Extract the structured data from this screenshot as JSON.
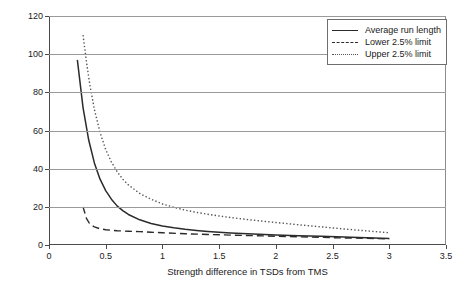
{
  "chart_data": {
    "type": "line",
    "title": "",
    "xlabel": "Strength difference in TSDs from TMS",
    "ylabel": "No. of results to detect action",
    "xlim": [
      0,
      3.5
    ],
    "ylim": [
      0,
      120
    ],
    "xticks": [
      "0",
      "0.5",
      "1",
      "1.5",
      "2",
      "2.5",
      "3",
      "3.5"
    ],
    "xtick_values": [
      0,
      0.5,
      1,
      1.5,
      2,
      2.5,
      3,
      3.5
    ],
    "yticks": [
      "0",
      "20",
      "40",
      "60",
      "80",
      "100",
      "120"
    ],
    "ytick_values": [
      0,
      20,
      40,
      60,
      80,
      100,
      120
    ],
    "grid": "horizontal",
    "legend_position": "top-right",
    "series": [
      {
        "name": "Average run length",
        "style": "solid",
        "color": "#2b2b2b",
        "x": [
          0.25,
          0.3,
          0.35,
          0.4,
          0.45,
          0.5,
          0.55,
          0.6,
          0.65,
          0.7,
          0.8,
          0.9,
          1.0,
          1.1,
          1.2,
          1.3,
          1.4,
          1.5,
          1.6,
          1.7,
          1.8,
          2.0,
          2.2,
          2.4,
          2.6,
          2.8,
          3.0
        ],
        "values": [
          97.0,
          72.0,
          55.0,
          43.0,
          34.5,
          28.5,
          24.0,
          20.5,
          18.0,
          16.0,
          13.2,
          11.3,
          10.0,
          9.0,
          8.2,
          7.6,
          7.1,
          6.7,
          6.3,
          6.0,
          5.8,
          5.3,
          4.9,
          4.6,
          4.2,
          3.8,
          3.4
        ]
      },
      {
        "name": "Lower 2.5% limit",
        "style": "dashed",
        "color": "#2b2b2b",
        "x": [
          0.3,
          0.33,
          0.36,
          0.4,
          0.45,
          0.5,
          0.6,
          0.7,
          0.8,
          0.9,
          1.0,
          1.2,
          1.4,
          1.6,
          1.8,
          2.0,
          2.2,
          2.4,
          2.6,
          2.8,
          3.0
        ],
        "values": [
          20.0,
          14.0,
          11.0,
          9.5,
          8.5,
          8.0,
          7.5,
          7.2,
          7.0,
          6.7,
          6.4,
          5.9,
          5.5,
          5.2,
          4.9,
          4.6,
          4.3,
          4.0,
          3.7,
          3.5,
          3.2
        ]
      },
      {
        "name": "Upper 2.5% limit",
        "style": "dotted",
        "color": "#555555",
        "x": [
          0.3,
          0.33,
          0.36,
          0.4,
          0.45,
          0.5,
          0.55,
          0.6,
          0.65,
          0.7,
          0.8,
          0.9,
          1.0,
          1.1,
          1.2,
          1.3,
          1.4,
          1.5,
          1.6,
          1.7,
          1.8,
          2.0,
          2.2,
          2.4,
          2.6,
          2.8,
          3.0
        ],
        "values": [
          110.0,
          96.0,
          84.0,
          71.0,
          59.0,
          50.0,
          43.5,
          38.5,
          34.5,
          31.5,
          27.0,
          24.0,
          21.5,
          19.8,
          18.3,
          17.1,
          16.1,
          15.2,
          14.4,
          13.7,
          13.0,
          11.8,
          10.6,
          9.5,
          8.4,
          7.4,
          6.4
        ]
      }
    ]
  },
  "legend": {
    "entries": [
      {
        "label": "Average run length"
      },
      {
        "label": "Lower 2.5% limit"
      },
      {
        "label": "Upper 2.5% limit"
      }
    ]
  }
}
